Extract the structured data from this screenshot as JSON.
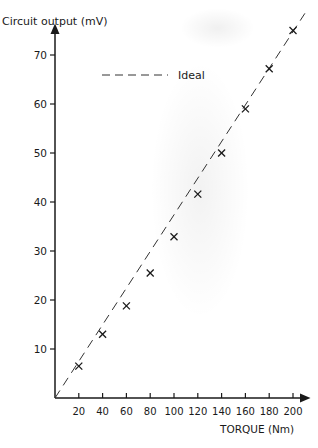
{
  "chart_data": {
    "type": "scatter",
    "title": "",
    "xlabel": "TORQUE (Nm)",
    "ylabel": "Circuit output (mV)",
    "xlim": [
      0,
      210
    ],
    "ylim": [
      0,
      78
    ],
    "x_ticks": [
      20,
      40,
      60,
      80,
      100,
      120,
      140,
      160,
      180,
      200
    ],
    "y_ticks": [
      10,
      20,
      30,
      40,
      50,
      60,
      70
    ],
    "grid": false,
    "legend": {
      "position": "upper-left",
      "entries": [
        "Ideal"
      ]
    },
    "series": [
      {
        "name": "Measured",
        "marker": "x",
        "x": [
          20,
          40,
          60,
          80,
          100,
          120,
          140,
          160,
          180,
          200
        ],
        "y": [
          6.5,
          13,
          18.8,
          25.5,
          32.9,
          41.6,
          50,
          59,
          67.2,
          75
        ]
      },
      {
        "name": "Ideal",
        "style": "dashed",
        "x": [
          0,
          210
        ],
        "y": [
          0,
          78.5
        ]
      }
    ]
  },
  "labels": {
    "ylabel": "Circuit output (mV)",
    "xlabel": "TORQUE (Nm)",
    "legend_ideal": "Ideal"
  }
}
